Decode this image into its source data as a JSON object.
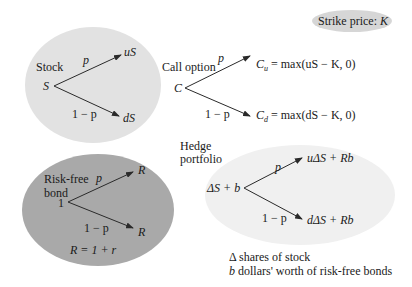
{
  "strike_badge": {
    "label": "Strike price: ",
    "var": "K"
  },
  "stock": {
    "title": "Stock",
    "root": "S",
    "up_prob": "p",
    "down_prob": "1 − p",
    "up_value": "uS",
    "down_value": "dS"
  },
  "call": {
    "title": "Call option",
    "root": "C",
    "up_prob": "p",
    "down_prob": "1 − p",
    "up_var": "C",
    "up_sub": "u",
    "up_expr": " = max(uS − K, 0)",
    "down_var": "C",
    "down_sub": "d",
    "down_expr": " = max(dS − K, 0)"
  },
  "bond": {
    "title_line1": "Risk-free",
    "title_line2": "bond",
    "root": "1",
    "up_prob": "p",
    "down_prob": "1 − p",
    "up_value": "R",
    "down_value": "R",
    "relation": "R = 1 + r"
  },
  "hedge": {
    "title_line1": "Hedge",
    "title_line2": "portfolio",
    "root": "ΔS + b",
    "up_prob": "p",
    "down_prob": "1 − p",
    "up_value": "uΔS + Rb",
    "down_value": "dΔS + Rb"
  },
  "legend": {
    "line1": "Δ shares of stock",
    "line2_var": "b",
    "line2_text": " dollars' worth of risk-free bonds"
  },
  "colors": {
    "stock_fill": "#e2e2e2",
    "bond_fill": "#a9a9a9",
    "hedge_fill": "#f0f0f0",
    "badge_fill": "#d6d6d6",
    "arrow": "#2a2a2a"
  }
}
